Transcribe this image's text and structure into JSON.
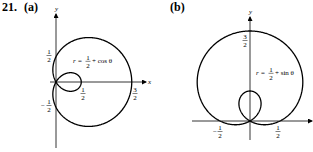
{
  "problem": {
    "number": "21.",
    "parts": [
      {
        "label": "(a)",
        "equation": {
          "lhs": "r =",
          "frac_num": "1",
          "frac_den": "2",
          "rhs": "+ cos θ"
        },
        "axes": {
          "x": "x",
          "y": "y"
        },
        "tick_labels": [
          {
            "name": "y-half",
            "num": "1",
            "den": "2",
            "sign": ""
          },
          {
            "name": "y-neg-half",
            "num": "1",
            "den": "2",
            "sign": "−"
          },
          {
            "name": "x-half",
            "num": "1",
            "den": "2",
            "sign": ""
          },
          {
            "name": "x-three-halves",
            "num": "3",
            "den": "2",
            "sign": ""
          }
        ]
      },
      {
        "label": "(b)",
        "equation": {
          "lhs": "r =",
          "frac_num": "1",
          "frac_den": "2",
          "rhs": "+ sin θ"
        },
        "axes": {
          "x": "",
          "y": "y"
        },
        "tick_labels": [
          {
            "name": "y-three-halves",
            "num": "3",
            "den": "2",
            "sign": ""
          },
          {
            "name": "x-neg-half",
            "num": "1",
            "den": "2",
            "sign": "−"
          },
          {
            "name": "x-half",
            "num": "1",
            "den": "2",
            "sign": ""
          }
        ]
      }
    ]
  },
  "chart_data": [
    {
      "type": "line",
      "title": "(a) r = 1/2 + cos θ",
      "curve": "limaçon with inner loop",
      "equation": "r = 1/2 + cos(theta)",
      "xlabel": "x",
      "ylabel": "y",
      "key_points": {
        "outer_right_x": 1.5,
        "inner_right_x": 0.5,
        "y_intercepts": [
          0.5,
          -0.5
        ]
      },
      "labeled_ticks": {
        "x": [
          "1/2",
          "3/2"
        ],
        "y": [
          "1/2",
          "-1/2"
        ]
      },
      "grid": false
    },
    {
      "type": "line",
      "title": "(b) r = 1/2 + sin θ",
      "curve": "limaçon with inner loop",
      "equation": "r = 1/2 + sin(theta)",
      "xlabel": "",
      "ylabel": "y",
      "key_points": {
        "outer_top_y": 1.5,
        "inner_top_y": 0.5,
        "x_intercepts": [
          -0.5,
          0.5
        ]
      },
      "labeled_ticks": {
        "x": [
          "-1/2",
          "1/2"
        ],
        "y": [
          "3/2"
        ]
      },
      "grid": false
    }
  ]
}
